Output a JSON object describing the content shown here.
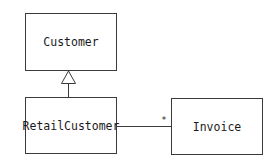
{
  "diagram": {
    "type": "uml-class-diagram",
    "classes": [
      {
        "id": "customer",
        "name": "Customer"
      },
      {
        "id": "retail_customer",
        "name": "RetailCustomer"
      },
      {
        "id": "invoice",
        "name": "Invoice"
      }
    ],
    "relationships": [
      {
        "type": "generalization",
        "from": "RetailCustomer",
        "to": "Customer"
      },
      {
        "type": "association",
        "from": "RetailCustomer",
        "to": "Invoice",
        "target_multiplicity": "*"
      }
    ],
    "labels": {
      "customer": "Customer",
      "retail_customer": "RetailCustomer",
      "invoice": "Invoice",
      "association_multiplicity": "*"
    }
  }
}
